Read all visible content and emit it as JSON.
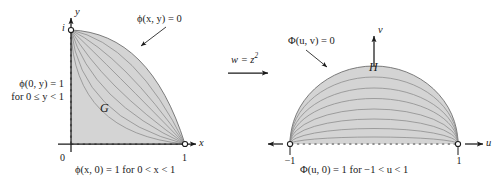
{
  "figure": {
    "background": "#ffffff",
    "fill_color": "#d4d4d4",
    "stroke_color": "#6e6e6e",
    "axis_color": "#1a1a1a",
    "text_color": "#1a1a1a"
  },
  "mapping": {
    "label": "w = z",
    "exponent": "2",
    "arrow": "right-arrow"
  },
  "left": {
    "region_label": "G",
    "axis_x_label": "x",
    "axis_y_label": "y",
    "tick_origin": "0",
    "tick_x_one": "1",
    "tick_y_i": "i",
    "top_condition": "ϕ(x, y) = 0",
    "left_condition_line1": "ϕ(0, y) = 1",
    "left_condition_line2": "for  0 ≤ y < 1",
    "bottom_condition": "ϕ(x, 0) = 1   for  0 < x < 1",
    "endpoint_markers": [
      "open-circle-at-1",
      "open-circle-at-i"
    ],
    "curve_count": 7
  },
  "right": {
    "region_label": "H",
    "axis_u_label": "u",
    "axis_v_label": "v",
    "tick_u_neg_one": "−1",
    "tick_u_one": "1",
    "top_condition": "Φ(u, v) = 0",
    "bottom_condition": "Φ(u, 0) = 1   for  −1 < u < 1",
    "endpoint_markers": [
      "open-circle-at-neg-1",
      "open-circle-at-1"
    ],
    "curve_count": 7
  }
}
